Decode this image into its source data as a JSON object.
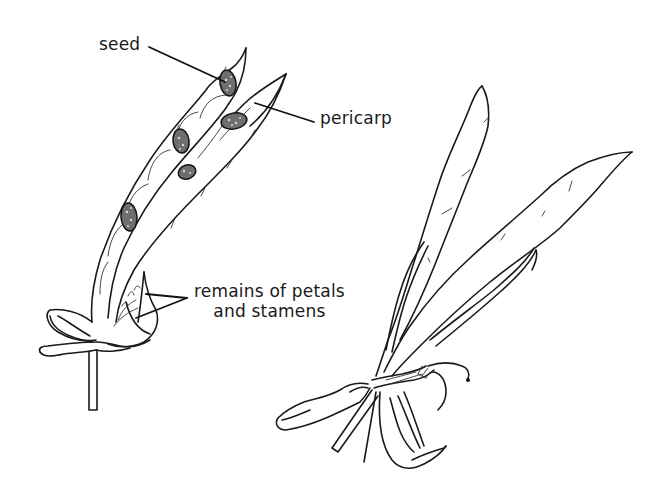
{
  "figure": {
    "colors": {
      "ink": "#1a1a1a",
      "background": "#ffffff",
      "seed_fill": "#6e6e6e"
    },
    "labels": {
      "seed": "seed",
      "pericarp": "pericarp",
      "remains_line1": "remains of petals",
      "remains_line2": "and stamens"
    },
    "parts": [
      {
        "id": "left-pod",
        "name": "opened pod with seeds"
      },
      {
        "id": "right-pod",
        "name": "pod with two valves and withered flower remains"
      }
    ],
    "seed_count_visible": 5
  }
}
